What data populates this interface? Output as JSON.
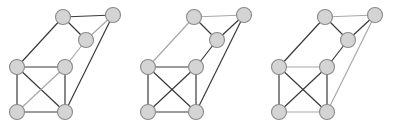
{
  "figure": {
    "title": "",
    "background_color": "#ffffff",
    "width": 393,
    "height": 130,
    "panel_count": 3
  },
  "style": {
    "node_fill": "#d4d4d4",
    "node_stroke": "#8a8a8a",
    "node_radius": 7.5,
    "node_stroke_width": 1.1,
    "edge_dark_color": "#3a3a3a",
    "edge_light_color": "#a8a8a8",
    "edge_width": 1.2
  },
  "graph_data": {
    "type": "graph",
    "node_count": 6,
    "node_labels": [
      "n1",
      "n2",
      "n3",
      "n4",
      "n5",
      "n6"
    ],
    "node_positions": {
      "n1": [
        63,
        17
      ],
      "n2": [
        113,
        15
      ],
      "n3": [
        86,
        40
      ],
      "n4": [
        17,
        67
      ],
      "n5": [
        65,
        67
      ],
      "n6": [
        17,
        112
      ],
      "n7": [
        65,
        112
      ]
    },
    "panels": [
      {
        "index": 0,
        "offset_x": 0,
        "label": "",
        "nodes": [
          {
            "id": "a",
            "x": 63,
            "y": 17
          },
          {
            "id": "b",
            "x": 113,
            "y": 15
          },
          {
            "id": "c",
            "x": 86,
            "y": 40
          },
          {
            "id": "d",
            "x": 17,
            "y": 67
          },
          {
            "id": "e",
            "x": 65,
            "y": 67
          },
          {
            "id": "f",
            "x": 17,
            "y": 112
          },
          {
            "id": "g",
            "x": 65,
            "y": 112
          }
        ],
        "edges": [
          {
            "from": "a",
            "to": "b",
            "shade": "dark"
          },
          {
            "from": "a",
            "to": "c",
            "shade": "dark"
          },
          {
            "from": "b",
            "to": "c",
            "shade": "light"
          },
          {
            "from": "a",
            "to": "d",
            "shade": "dark"
          },
          {
            "from": "c",
            "to": "e",
            "shade": "light"
          },
          {
            "from": "b",
            "to": "g",
            "shade": "dark"
          },
          {
            "from": "d",
            "to": "e",
            "shade": "dark"
          },
          {
            "from": "d",
            "to": "f",
            "shade": "dark"
          },
          {
            "from": "e",
            "to": "g",
            "shade": "dark"
          },
          {
            "from": "f",
            "to": "g",
            "shade": "dark"
          },
          {
            "from": "d",
            "to": "g",
            "shade": "dark"
          },
          {
            "from": "e",
            "to": "f",
            "shade": "light"
          }
        ]
      },
      {
        "index": 1,
        "offset_x": 131,
        "label": "",
        "nodes": [
          {
            "id": "a",
            "x": 63,
            "y": 17
          },
          {
            "id": "b",
            "x": 113,
            "y": 15
          },
          {
            "id": "c",
            "x": 86,
            "y": 40
          },
          {
            "id": "d",
            "x": 17,
            "y": 67
          },
          {
            "id": "e",
            "x": 65,
            "y": 67
          },
          {
            "id": "f",
            "x": 17,
            "y": 112
          },
          {
            "id": "g",
            "x": 65,
            "y": 112
          }
        ],
        "edges": [
          {
            "from": "a",
            "to": "b",
            "shade": "light"
          },
          {
            "from": "a",
            "to": "c",
            "shade": "dark"
          },
          {
            "from": "b",
            "to": "c",
            "shade": "dark"
          },
          {
            "from": "a",
            "to": "d",
            "shade": "light"
          },
          {
            "from": "c",
            "to": "e",
            "shade": "dark"
          },
          {
            "from": "b",
            "to": "g",
            "shade": "dark"
          },
          {
            "from": "d",
            "to": "e",
            "shade": "dark"
          },
          {
            "from": "d",
            "to": "f",
            "shade": "dark"
          },
          {
            "from": "e",
            "to": "g",
            "shade": "dark"
          },
          {
            "from": "f",
            "to": "g",
            "shade": "dark"
          },
          {
            "from": "d",
            "to": "g",
            "shade": "dark"
          },
          {
            "from": "e",
            "to": "f",
            "shade": "dark"
          }
        ]
      },
      {
        "index": 2,
        "offset_x": 262,
        "label": "",
        "nodes": [
          {
            "id": "a",
            "x": 63,
            "y": 17
          },
          {
            "id": "b",
            "x": 113,
            "y": 15
          },
          {
            "id": "c",
            "x": 86,
            "y": 40
          },
          {
            "id": "d",
            "x": 17,
            "y": 67
          },
          {
            "id": "e",
            "x": 65,
            "y": 67
          },
          {
            "id": "f",
            "x": 17,
            "y": 112
          },
          {
            "id": "g",
            "x": 65,
            "y": 112
          }
        ],
        "edges": [
          {
            "from": "a",
            "to": "b",
            "shade": "light"
          },
          {
            "from": "a",
            "to": "c",
            "shade": "dark"
          },
          {
            "from": "b",
            "to": "c",
            "shade": "dark"
          },
          {
            "from": "a",
            "to": "d",
            "shade": "dark"
          },
          {
            "from": "c",
            "to": "e",
            "shade": "dark"
          },
          {
            "from": "b",
            "to": "g",
            "shade": "light"
          },
          {
            "from": "d",
            "to": "e",
            "shade": "light"
          },
          {
            "from": "d",
            "to": "f",
            "shade": "dark"
          },
          {
            "from": "e",
            "to": "g",
            "shade": "dark"
          },
          {
            "from": "f",
            "to": "g",
            "shade": "light"
          },
          {
            "from": "d",
            "to": "g",
            "shade": "dark"
          },
          {
            "from": "e",
            "to": "f",
            "shade": "dark"
          }
        ]
      }
    ]
  }
}
